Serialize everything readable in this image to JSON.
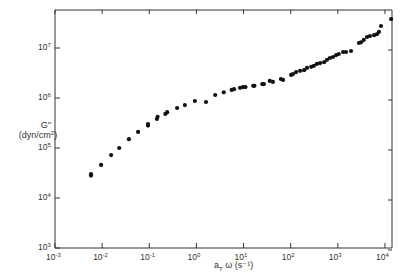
{
  "chart_data": {
    "type": "scatter",
    "title": "",
    "xlabel": "a_T ω (s⁻¹)",
    "ylabel": "G'' (dyn/cm²)",
    "ylabel_line1": "G''",
    "ylabel_line2": "(dyn/cm²)",
    "xlabel_parts": {
      "a": "a",
      "sub": "T",
      "omega": "ω",
      "unit": "(s⁻¹)"
    },
    "xscale": "log",
    "yscale": "log",
    "xlim": [
      0.001,
      14000
    ],
    "ylim": [
      1000,
      60000000
    ],
    "grid": false,
    "legend": null,
    "x_ticks": [
      {
        "exp": "-3",
        "value": 0.001
      },
      {
        "exp": "-2",
        "value": 0.01
      },
      {
        "exp": "-1",
        "value": 0.1
      },
      {
        "exp": "0",
        "value": 1
      },
      {
        "exp": "1",
        "value": 10
      },
      {
        "exp": "2",
        "value": 100
      },
      {
        "exp": "3",
        "value": 1000
      },
      {
        "exp": "4",
        "value": 10000
      }
    ],
    "y_ticks": [
      {
        "exp": "3",
        "value": 1000
      },
      {
        "exp": "4",
        "value": 10000
      },
      {
        "exp": "5",
        "value": 100000
      },
      {
        "exp": "6",
        "value": 1000000
      },
      {
        "exp": "7",
        "value": 10000000
      }
    ],
    "series": [
      {
        "name": "G''",
        "marker": "filled-circle",
        "color": "#111111",
        "points": [
          [
            0.0058,
            30000
          ],
          [
            0.0058,
            28000
          ],
          [
            0.0095,
            46000
          ],
          [
            0.0155,
            72000
          ],
          [
            0.023,
            100000
          ],
          [
            0.037,
            150000
          ],
          [
            0.058,
            210000
          ],
          [
            0.094,
            280000
          ],
          [
            0.094,
            300000
          ],
          [
            0.145,
            380000
          ],
          [
            0.15,
            420000
          ],
          [
            0.22,
            480000
          ],
          [
            0.24,
            520000
          ],
          [
            0.39,
            630000
          ],
          [
            0.57,
            720000
          ],
          [
            0.93,
            870000
          ],
          [
            1.6,
            830000
          ],
          [
            2.5,
            1150000
          ],
          [
            3.8,
            1300000
          ],
          [
            5.6,
            1450000
          ],
          [
            6.3,
            1500000
          ],
          [
            8.4,
            1600000
          ],
          [
            9.7,
            1650000
          ],
          [
            11,
            1650000
          ],
          [
            16,
            1750000
          ],
          [
            17,
            1750000
          ],
          [
            25,
            1900000
          ],
          [
            27,
            1900000
          ],
          [
            36,
            2200000
          ],
          [
            42,
            2100000
          ],
          [
            62,
            2400000
          ],
          [
            69,
            2300000
          ],
          [
            102,
            2900000
          ],
          [
            112,
            3000000
          ],
          [
            130,
            3300000
          ],
          [
            158,
            3500000
          ],
          [
            192,
            3600000
          ],
          [
            222,
            4000000
          ],
          [
            272,
            4200000
          ],
          [
            311,
            4400000
          ],
          [
            360,
            4800000
          ],
          [
            420,
            5000000
          ],
          [
            510,
            5200000
          ],
          [
            590,
            5800000
          ],
          [
            680,
            6300000
          ],
          [
            790,
            6600000
          ],
          [
            920,
            7200000
          ],
          [
            1050,
            7600000
          ],
          [
            1290,
            8300000
          ],
          [
            1490,
            8300000
          ],
          [
            1900,
            8700000
          ],
          [
            2800,
            12600000
          ],
          [
            3100,
            13000000
          ],
          [
            3560,
            14500000
          ],
          [
            4150,
            16600000
          ],
          [
            4800,
            17400000
          ],
          [
            5870,
            18000000
          ],
          [
            6800,
            19000000
          ],
          [
            7440,
            21000000
          ],
          [
            8250,
            27500000
          ],
          [
            13500,
            38000000
          ]
        ]
      }
    ]
  },
  "axes": {
    "tick_base": "10"
  }
}
